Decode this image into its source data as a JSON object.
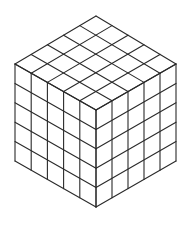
{
  "diagram": {
    "divisions": 5,
    "stroke_color": "#2a2a2a",
    "background": "#ffffff",
    "stroke_width": 1.1,
    "vertices": {
      "top": [
        96,
        16
      ],
      "left": [
        15,
        64
      ],
      "right": [
        176,
        64
      ],
      "center": [
        96,
        110
      ],
      "bottom_left": [
        15,
        161
      ],
      "bottom_right": [
        176,
        161
      ],
      "bottom": [
        96,
        207
      ]
    }
  }
}
